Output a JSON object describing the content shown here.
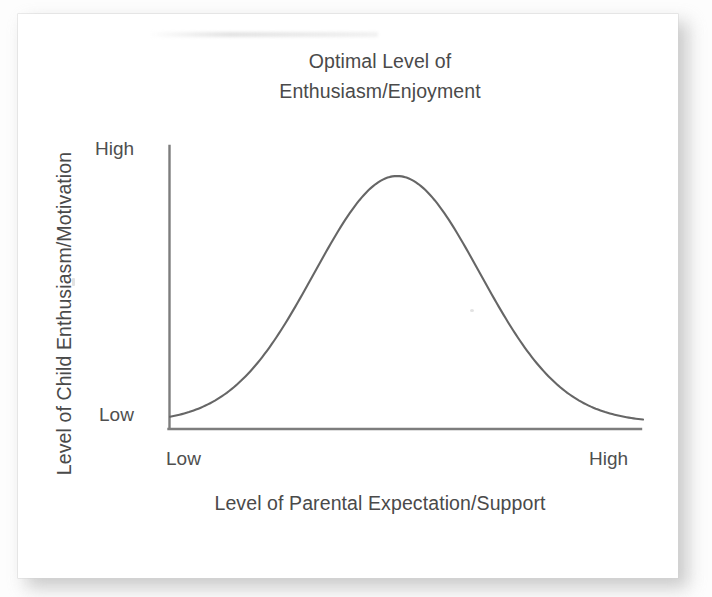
{
  "figure": {
    "title_line_1": "Optimal Level of",
    "title_line_2": "Enthusiasm/Enjoyment",
    "y_axis_title": "Level of Child Enthusiasm/Motivation",
    "x_axis_title": "Level of Parental Expectation/Support",
    "y_tick_high": "High",
    "y_tick_low": "Low",
    "x_tick_low": "Low",
    "x_tick_high": "High",
    "ink_color": "#4a4a4a",
    "curve_color": "#666666",
    "axis_color": "#7a7a7a",
    "card_color": "#ffffff",
    "background_color": "#fdfdfd"
  },
  "chart_data": {
    "type": "line",
    "title": "Optimal Level of Enthusiasm/Enjoyment",
    "xlabel": "Level of Parental Expectation/Support",
    "ylabel": "Level of Child Enthusiasm/Motivation",
    "xtick_labels": [
      "Low",
      "High"
    ],
    "ytick_labels": [
      "Low",
      "High"
    ],
    "xlim": [
      0,
      100
    ],
    "ylim": [
      0,
      100
    ],
    "grid": false,
    "legend": "none",
    "annotations": [
      "Optimal Level of Enthusiasm/Enjoyment"
    ],
    "series": [
      {
        "name": "Child enthusiasm/motivation",
        "shape": "gaussian bell curve (inverted-U)",
        "peak_x": 48,
        "x": [
          0,
          5,
          10,
          15,
          20,
          25,
          30,
          35,
          40,
          45,
          48,
          50,
          55,
          60,
          65,
          70,
          75,
          80,
          85,
          90,
          95,
          100
        ],
        "values": [
          1.5,
          2.5,
          5,
          9,
          16,
          27,
          42,
          60,
          78,
          93,
          100,
          99,
          92,
          80,
          64,
          47,
          32,
          20,
          11,
          6,
          3,
          1.5
        ]
      }
    ]
  }
}
